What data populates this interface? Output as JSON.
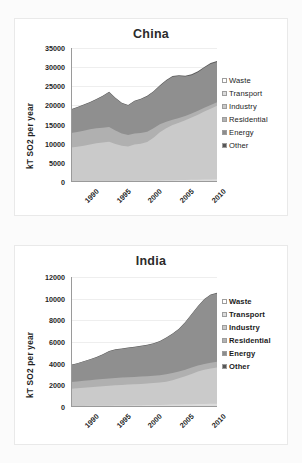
{
  "page": {
    "background": "#fbfbfb",
    "panel_background": "#ffffff"
  },
  "series_colors": {
    "waste": "#ffffff",
    "transport": "#dcdcdc",
    "industry": "#cacaca",
    "residential": "#b0b0b0",
    "energy": "#8f8f8f",
    "other": "#595959"
  },
  "legend": {
    "items": [
      {
        "label": "Waste",
        "color": "#ffffff"
      },
      {
        "label": "Transport",
        "color": "#dcdcdc"
      },
      {
        "label": "Industry",
        "color": "#c9c9c9"
      },
      {
        "label": "Residential",
        "color": "#b2b2b2"
      },
      {
        "label": "Energy",
        "color": "#8c8c8c"
      },
      {
        "label": "Other",
        "color": "#565656"
      }
    ]
  },
  "chart_data": [
    {
      "type": "area",
      "stacked": true,
      "title": "China",
      "xlabel": "",
      "ylabel": "kT SO2 per year",
      "ylim": [
        0,
        35000
      ],
      "yticks": [
        35000,
        30000,
        25000,
        20000,
        15000,
        10000,
        5000,
        0
      ],
      "xlim": [
        1990,
        2013
      ],
      "xticks": [
        1990,
        1995,
        2000,
        2005,
        2010
      ],
      "x": [
        1990,
        1991,
        1992,
        1993,
        1994,
        1995,
        1996,
        1997,
        1998,
        1999,
        2000,
        2001,
        2002,
        2003,
        2004,
        2005,
        2006,
        2007,
        2008,
        2009,
        2010,
        2011,
        2012,
        2013
      ],
      "grid": true,
      "legend_position": "right",
      "series": [
        {
          "name": "Waste",
          "values": [
            60,
            62,
            64,
            66,
            68,
            70,
            72,
            74,
            76,
            78,
            80,
            82,
            85,
            88,
            92,
            96,
            100,
            104,
            108,
            112,
            116,
            120,
            124,
            128
          ]
        },
        {
          "name": "Transport",
          "values": [
            120,
            125,
            132,
            140,
            150,
            160,
            170,
            180,
            190,
            200,
            215,
            230,
            250,
            275,
            300,
            330,
            360,
            390,
            420,
            450,
            480,
            510,
            540,
            570
          ]
        },
        {
          "name": "Industry",
          "values": [
            8800,
            9000,
            9300,
            9600,
            9900,
            10100,
            10300,
            9700,
            9200,
            9000,
            9500,
            9700,
            10100,
            11200,
            12600,
            13600,
            14400,
            15000,
            15600,
            16300,
            17000,
            17800,
            18500,
            19200
          ]
        },
        {
          "name": "Residential",
          "values": [
            3800,
            3850,
            3900,
            3950,
            3900,
            3850,
            3800,
            3500,
            3200,
            3000,
            2900,
            2800,
            2700,
            2500,
            2100,
            1700,
            1400,
            1200,
            1100,
            1050,
            1000,
            980,
            960,
            950
          ]
        },
        {
          "name": "Energy",
          "values": [
            6100,
            6400,
            6700,
            7000,
            7500,
            8200,
            9100,
            8400,
            7900,
            7700,
            8400,
            8800,
            9200,
            9500,
            10000,
            10700,
            11200,
            11000,
            10300,
            10000,
            10100,
            10400,
            10700,
            10500
          ]
        },
        {
          "name": "Other",
          "values": [
            120,
            125,
            130,
            135,
            140,
            145,
            150,
            150,
            150,
            150,
            155,
            160,
            165,
            170,
            180,
            190,
            200,
            210,
            215,
            220,
            225,
            230,
            235,
            240
          ]
        }
      ]
    },
    {
      "type": "area",
      "stacked": true,
      "title": "India",
      "xlabel": "",
      "ylabel": "kT SO2 per year",
      "ylim": [
        0,
        12000
      ],
      "yticks": [
        12000,
        10000,
        8000,
        6000,
        4000,
        2000,
        0
      ],
      "xlim": [
        1990,
        2013
      ],
      "xticks": [
        1990,
        1995,
        2000,
        2005,
        2010
      ],
      "x": [
        1990,
        1991,
        1992,
        1993,
        1994,
        1995,
        1996,
        1997,
        1998,
        1999,
        2000,
        2001,
        2002,
        2003,
        2004,
        2005,
        2006,
        2007,
        2008,
        2009,
        2010,
        2011,
        2012,
        2013
      ],
      "grid": true,
      "legend_position": "right",
      "series": [
        {
          "name": "Waste",
          "values": [
            30,
            31,
            32,
            33,
            34,
            35,
            36,
            37,
            38,
            40,
            42,
            44,
            46,
            48,
            50,
            52,
            55,
            58,
            60,
            62,
            65,
            68,
            70,
            72
          ]
        },
        {
          "name": "Transport",
          "values": [
            60,
            64,
            68,
            72,
            78,
            84,
            90,
            96,
            102,
            108,
            115,
            122,
            130,
            138,
            146,
            155,
            165,
            175,
            185,
            195,
            205,
            215,
            225,
            235
          ]
        },
        {
          "name": "Industry",
          "values": [
            1600,
            1640,
            1680,
            1720,
            1760,
            1800,
            1840,
            1880,
            1900,
            1920,
            1940,
            1960,
            1990,
            2020,
            2060,
            2120,
            2250,
            2420,
            2600,
            2800,
            3000,
            3150,
            3250,
            3350
          ]
        },
        {
          "name": "Residential",
          "values": [
            620,
            630,
            640,
            650,
            655,
            660,
            665,
            670,
            672,
            674,
            676,
            678,
            680,
            682,
            684,
            686,
            660,
            630,
            600,
            580,
            560,
            545,
            535,
            525
          ]
        },
        {
          "name": "Energy",
          "values": [
            1550,
            1650,
            1780,
            1900,
            2050,
            2250,
            2500,
            2600,
            2650,
            2700,
            2750,
            2800,
            2850,
            2950,
            3100,
            3350,
            3600,
            3900,
            4350,
            4900,
            5450,
            5950,
            6250,
            6300
          ]
        },
        {
          "name": "Other",
          "values": [
            30,
            31,
            32,
            33,
            34,
            35,
            36,
            37,
            38,
            39,
            40,
            41,
            42,
            43,
            44,
            45,
            46,
            47,
            48,
            49,
            50,
            51,
            52,
            53
          ]
        }
      ]
    }
  ]
}
